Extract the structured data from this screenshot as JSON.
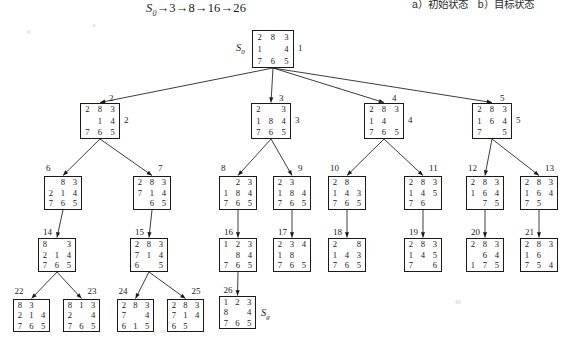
{
  "header": {
    "solution_path": "S0→3→8→16→26",
    "path_parts": [
      "S",
      "0",
      "→3→8→16→26"
    ],
    "corner_caption": "a）初始状态　b）目标状态"
  },
  "diagram": {
    "type": "search-tree",
    "puzzle": "8-puzzle",
    "blank_symbol": "",
    "start_label": "S0",
    "goal_label": "Sg",
    "node_count": 26
  },
  "nodes": [
    {
      "id": "root",
      "num": "1",
      "tiles": [
        "2",
        "8",
        "3",
        "1",
        "",
        "4",
        "7",
        "6",
        "5"
      ],
      "side_label": "S0"
    },
    {
      "id": "n2",
      "num": "2",
      "tiles": [
        "2",
        "8",
        "3",
        "",
        "1",
        "4",
        "7",
        "6",
        "5"
      ]
    },
    {
      "id": "n3",
      "num": "3",
      "tiles": [
        "2",
        "",
        "3",
        "1",
        "8",
        "4",
        "7",
        "6",
        "5"
      ]
    },
    {
      "id": "n4",
      "num": "4",
      "tiles": [
        "2",
        "8",
        "3",
        "1",
        "4",
        "",
        "7",
        "6",
        "5"
      ]
    },
    {
      "id": "n5",
      "num": "5",
      "tiles": [
        "2",
        "8",
        "3",
        "1",
        "6",
        "4",
        "7",
        "",
        "5"
      ]
    },
    {
      "id": "n6",
      "num": "6",
      "tiles": [
        "",
        "8",
        "3",
        "2",
        "1",
        "4",
        "7",
        "6",
        "5"
      ]
    },
    {
      "id": "n7",
      "num": "7",
      "tiles": [
        "2",
        "8",
        "3",
        "7",
        "1",
        "4",
        "",
        "6",
        "5"
      ]
    },
    {
      "id": "n8",
      "num": "8",
      "tiles": [
        "",
        "2",
        "3",
        "1",
        "8",
        "4",
        "7",
        "6",
        "5"
      ]
    },
    {
      "id": "n9",
      "num": "9",
      "tiles": [
        "2",
        "3",
        "",
        "1",
        "8",
        "4",
        "7",
        "6",
        "5"
      ]
    },
    {
      "id": "n10",
      "num": "10",
      "tiles": [
        "2",
        "8",
        "",
        "1",
        "4",
        "3",
        "7",
        "6",
        "5"
      ]
    },
    {
      "id": "n11",
      "num": "11",
      "tiles": [
        "2",
        "8",
        "3",
        "1",
        "4",
        "5",
        "7",
        "6",
        ""
      ]
    },
    {
      "id": "n12",
      "num": "12",
      "tiles": [
        "2",
        "8",
        "3",
        "1",
        "6",
        "4",
        "",
        "7",
        "5"
      ]
    },
    {
      "id": "n13",
      "num": "13",
      "tiles": [
        "2",
        "8",
        "3",
        "1",
        "6",
        "4",
        "7",
        "5",
        ""
      ]
    },
    {
      "id": "n14",
      "num": "14",
      "tiles": [
        "8",
        "",
        "3",
        "2",
        "1",
        "4",
        "7",
        "6",
        "5"
      ]
    },
    {
      "id": "n15",
      "num": "15",
      "tiles": [
        "2",
        "8",
        "3",
        "7",
        "1",
        "4",
        "6",
        "",
        "5"
      ]
    },
    {
      "id": "n16",
      "num": "16",
      "tiles": [
        "1",
        "2",
        "3",
        "",
        "8",
        "4",
        "7",
        "6",
        "5"
      ]
    },
    {
      "id": "n17",
      "num": "17",
      "tiles": [
        "2",
        "3",
        "4",
        "1",
        "8",
        "",
        "7",
        "6",
        "5"
      ]
    },
    {
      "id": "n18",
      "num": "18",
      "tiles": [
        "2",
        "",
        "8",
        "1",
        "4",
        "3",
        "7",
        "6",
        "5"
      ]
    },
    {
      "id": "n19",
      "num": "19",
      "tiles": [
        "2",
        "8",
        "3",
        "1",
        "4",
        "5",
        "7",
        "",
        "6"
      ]
    },
    {
      "id": "n20",
      "num": "20",
      "tiles": [
        "2",
        "8",
        "3",
        "",
        "6",
        "4",
        "1",
        "7",
        "5"
      ]
    },
    {
      "id": "n21",
      "num": "21",
      "tiles": [
        "2",
        "8",
        "3",
        "1",
        "6",
        "",
        "7",
        "5",
        "4"
      ]
    },
    {
      "id": "n22",
      "num": "22",
      "tiles": [
        "8",
        "3",
        "",
        "2",
        "1",
        "4",
        "7",
        "6",
        "5"
      ]
    },
    {
      "id": "n23",
      "num": "23",
      "tiles": [
        "8",
        "1",
        "3",
        "2",
        "",
        "4",
        "7",
        "6",
        "5"
      ]
    },
    {
      "id": "n24",
      "num": "24",
      "tiles": [
        "2",
        "8",
        "3",
        "7",
        "",
        "4",
        "6",
        "1",
        "5"
      ]
    },
    {
      "id": "n25",
      "num": "25",
      "tiles": [
        "2",
        "8",
        "3",
        "7",
        "1",
        "4",
        "6",
        "5",
        ""
      ]
    },
    {
      "id": "n26",
      "num": "26",
      "tiles": [
        "1",
        "2",
        "3",
        "8",
        "",
        "4",
        "7",
        "6",
        "5"
      ],
      "side_label": "Sg"
    }
  ],
  "edges": [
    {
      "from": "root",
      "to": "n2"
    },
    {
      "from": "root",
      "to": "n3"
    },
    {
      "from": "root",
      "to": "n4"
    },
    {
      "from": "root",
      "to": "n5"
    },
    {
      "from": "n2",
      "to": "n6"
    },
    {
      "from": "n2",
      "to": "n7"
    },
    {
      "from": "n3",
      "to": "n8"
    },
    {
      "from": "n3",
      "to": "n9"
    },
    {
      "from": "n4",
      "to": "n10"
    },
    {
      "from": "n4",
      "to": "n11"
    },
    {
      "from": "n5",
      "to": "n12"
    },
    {
      "from": "n5",
      "to": "n13"
    },
    {
      "from": "n6",
      "to": "n14"
    },
    {
      "from": "n7",
      "to": "n15"
    },
    {
      "from": "n8",
      "to": "n16"
    },
    {
      "from": "n9",
      "to": "n17"
    },
    {
      "from": "n10",
      "to": "n18"
    },
    {
      "from": "n11",
      "to": "n19"
    },
    {
      "from": "n12",
      "to": "n20"
    },
    {
      "from": "n13",
      "to": "n21"
    },
    {
      "from": "n14",
      "to": "n22"
    },
    {
      "from": "n14",
      "to": "n23"
    },
    {
      "from": "n15",
      "to": "n24"
    },
    {
      "from": "n15",
      "to": "n25"
    },
    {
      "from": "n16",
      "to": "n26"
    }
  ]
}
